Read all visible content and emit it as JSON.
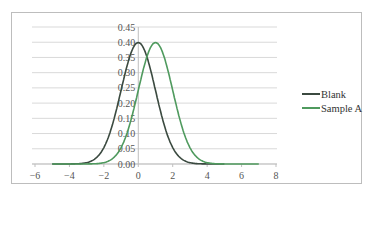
{
  "chart_data": {
    "type": "line",
    "title": "",
    "xlabel": "",
    "ylabel": "",
    "xlim": [
      -6,
      8
    ],
    "ylim": [
      0,
      0.45
    ],
    "x_ticks": [
      "-6",
      "-4",
      "-2",
      "0",
      "2",
      "4",
      "6",
      "8"
    ],
    "y_ticks": [
      "0.00",
      "0.05",
      "0.10",
      "0.15",
      "0.20",
      "0.25",
      "0.30",
      "0.35",
      "0.40",
      "0.45"
    ],
    "grid": "horizontal",
    "legend_position": "right",
    "series": [
      {
        "name": "Blank",
        "color": "#3b4a40",
        "distribution": "normal",
        "mean": 0,
        "sd": 1,
        "x_range": [
          -5,
          5
        ],
        "x": [
          -5,
          -4,
          -3,
          -2,
          -1.5,
          -1,
          -0.5,
          0,
          0.5,
          1,
          1.5,
          2,
          3,
          4,
          5
        ],
        "y": [
          0.0,
          0.0,
          0.0,
          0.05,
          0.13,
          0.24,
          0.35,
          0.4,
          0.35,
          0.24,
          0.13,
          0.05,
          0.0,
          0.0,
          0.0
        ]
      },
      {
        "name": "Sample A",
        "color": "#4f9a5e",
        "distribution": "normal",
        "mean": 1,
        "sd": 1,
        "x_range": [
          -5,
          7
        ],
        "x": [
          -5,
          -3,
          -2,
          -1,
          -0.5,
          0,
          0.5,
          1,
          1.5,
          2,
          2.5,
          3,
          4,
          5,
          7
        ],
        "y": [
          0.0,
          0.0,
          0.0,
          0.05,
          0.13,
          0.24,
          0.35,
          0.4,
          0.35,
          0.24,
          0.13,
          0.05,
          0.0,
          0.0,
          0.0
        ]
      }
    ]
  },
  "legend": {
    "items": [
      {
        "label": "Blank",
        "color": "#3b4a40"
      },
      {
        "label": "Sample A",
        "color": "#4f9a5e"
      }
    ]
  }
}
